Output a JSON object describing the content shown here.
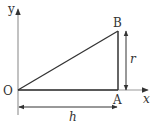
{
  "diagram": {
    "title": "",
    "labels": {
      "y_axis": "y",
      "x_axis": "x",
      "origin": "O",
      "point_a": "A",
      "point_b": "B",
      "height": "r",
      "length": "h"
    },
    "colors": {
      "axis": "#999999",
      "triangle": "#333333",
      "text": "#333333"
    }
  }
}
